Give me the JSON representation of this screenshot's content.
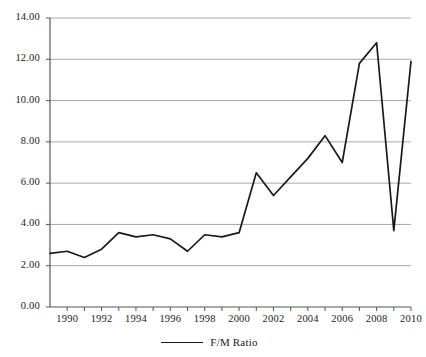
{
  "chart_data": {
    "type": "line",
    "title": "",
    "xlabel": "",
    "ylabel": "",
    "xlim": [
      1989,
      2010
    ],
    "ylim": [
      0.0,
      14.0
    ],
    "grid": true,
    "legend_position": "bottom-center",
    "y_ticks": [
      "0.00",
      "2.00",
      "4.00",
      "6.00",
      "8.00",
      "10.00",
      "12.00",
      "14.00"
    ],
    "y_tick_values": [
      0,
      2,
      4,
      6,
      8,
      10,
      12,
      14
    ],
    "x_ticks": [
      "1990",
      "1992",
      "1994",
      "1996",
      "1998",
      "2000",
      "2002",
      "2004",
      "2006",
      "2008",
      "2010"
    ],
    "x_tick_values": [
      1990,
      1992,
      1994,
      1996,
      1998,
      2000,
      2002,
      2004,
      2006,
      2008,
      2010
    ],
    "x": [
      1989,
      1990,
      1991,
      1992,
      1993,
      1994,
      1995,
      1996,
      1997,
      1998,
      1999,
      2000,
      2001,
      2002,
      2003,
      2004,
      2005,
      2006,
      2007,
      2008,
      2009,
      2010
    ],
    "series": [
      {
        "name": "F/M Ratio",
        "color": "#1a1a1a",
        "values": [
          2.6,
          2.7,
          2.4,
          2.8,
          3.6,
          3.4,
          3.5,
          3.3,
          2.7,
          3.5,
          3.4,
          3.6,
          6.5,
          5.4,
          6.3,
          7.2,
          8.3,
          7.0,
          11.8,
          12.8,
          3.7,
          11.9
        ]
      }
    ]
  },
  "legend": {
    "entries": [
      {
        "label": "F/M Ratio",
        "color": "#1a1a1a"
      }
    ]
  },
  "axis_colors": {
    "gridline": "#a8a8a8",
    "axis": "#555555",
    "tick": "#555555"
  }
}
